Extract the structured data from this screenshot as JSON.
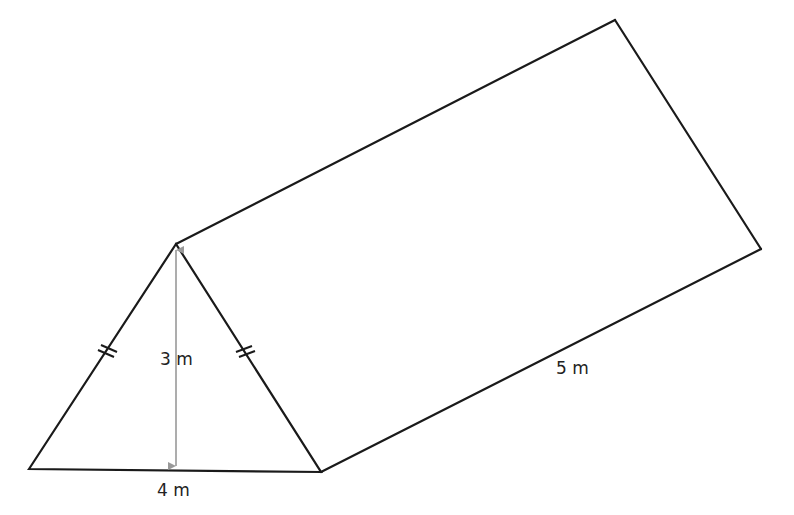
{
  "figure": {
    "type": "triangular-prism",
    "colors": {
      "edge": "#1a1a1a",
      "dimension_line": "#999999",
      "label": "#222222",
      "background": "#ffffff"
    },
    "vertices": {
      "front_bottom_left": [
        29,
        469
      ],
      "front_apex": [
        176,
        244
      ],
      "front_bottom_right": [
        321,
        472
      ],
      "back_apex": [
        615,
        20
      ],
      "back_bottom_right": [
        761,
        249
      ]
    },
    "equal_side_marks": "double-tick"
  },
  "labels": {
    "height": "3 m",
    "base": "4 m",
    "length": "5 m"
  }
}
